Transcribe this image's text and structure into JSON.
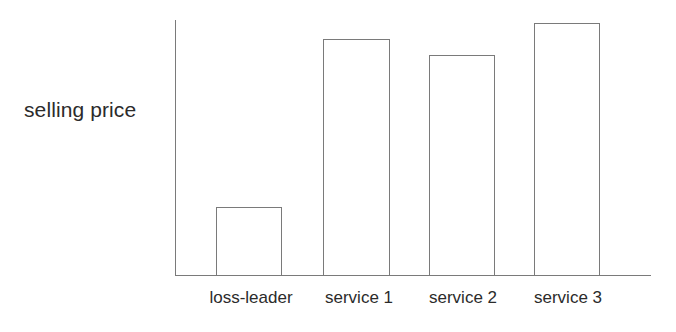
{
  "chart_data": {
    "type": "bar",
    "title": "",
    "subtitle": "",
    "xlabel": "",
    "ylabel": "selling price",
    "categories": [
      "loss-leader",
      "service 1",
      "service 2",
      "service 3"
    ],
    "values": [
      27,
      93,
      87,
      99
    ],
    "ylim": [
      0,
      100
    ],
    "grid": false,
    "legend": false,
    "legend_position": "none",
    "annotations": [],
    "axis_ticks": {
      "x": [
        "loss-leader",
        "service 1",
        "service 2",
        "service 3"
      ],
      "y": []
    },
    "style": {
      "bar_fill": "#ffffff",
      "bar_stroke": "#7a7a7a",
      "axis_color": "#7a7a7a",
      "text_color": "#2b2b2b",
      "background": "#ffffff"
    },
    "bar_geometry": [
      {
        "label": "loss-leader",
        "left_pct": 8.6,
        "width_pct": 13.9,
        "height_pct": 27.0
      },
      {
        "label": "service 1",
        "left_pct": 31.1,
        "width_pct": 14.1,
        "height_pct": 92.5
      },
      {
        "label": "service 2",
        "left_pct": 53.4,
        "width_pct": 13.9,
        "height_pct": 86.5
      },
      {
        "label": "service 3",
        "left_pct": 75.4,
        "width_pct": 13.9,
        "height_pct": 99.0
      }
    ],
    "label_positions_px": [
      251,
      359,
      463,
      568
    ]
  }
}
